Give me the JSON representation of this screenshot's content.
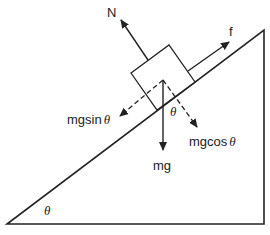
{
  "diagram": {
    "type": "free-body-diagram",
    "colors": {
      "line": "#222222",
      "background": "#ffffff"
    },
    "forces": [
      {
        "id": "normal",
        "label": "N",
        "style": "solid"
      },
      {
        "id": "friction",
        "label": "f",
        "style": "solid"
      },
      {
        "id": "weight",
        "label": "mg",
        "style": "solid"
      },
      {
        "id": "parallel",
        "label_text": "mgsin",
        "label_symbol": "θ",
        "style": "dashed"
      },
      {
        "id": "perpendicular",
        "label_text": "mgcos",
        "label_symbol": "θ",
        "style": "dashed"
      }
    ],
    "angles": {
      "incline": "θ",
      "between_weight_and_perpendicular": "θ"
    }
  }
}
